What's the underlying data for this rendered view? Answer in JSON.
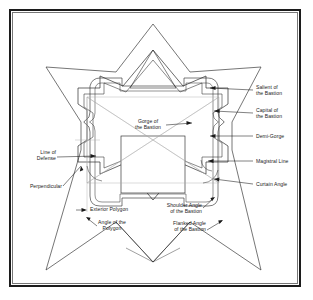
{
  "colors": {
    "frame": "#1c1c1c",
    "frame_inner": "#777777",
    "line": "#2b2b2b",
    "line_light": "#9a9a9a",
    "leader": "#1a1a1a",
    "text": "#1a1a1a",
    "background": "#ffffff"
  },
  "labels": {
    "salient": "Salient of\nthe Bastion",
    "capital": "Capital of\nthe Bastion",
    "demi_gorge": "Demi-Gorge",
    "magistral": "Magistral Line",
    "curtain_angle": "Curtain Angle",
    "gorge": "Gorge of\nthe Bastion",
    "line_of_defense": "Line of\nDefense",
    "perpendicular": "Perpendicular",
    "exterior_polygon": "Exterior Polygon",
    "angle_of_polygon": "Angle of the\nPolygon",
    "shoulder_angle": "Shoulder Angle\nof the Bastion",
    "flanked_angle": "Flanked Angle\nof the Bastion"
  },
  "geometry": {
    "outer_rampart": "M153,25 L190,73 L261,68 L238,118 L238,146 L261,232 L190,224 L153,262 L116,224 L46,232 L69,146 L69,118 L46,68 L116,73 Z",
    "center_square": {
      "x": 121,
      "y": 136,
      "w": 64,
      "h": 57
    }
  }
}
